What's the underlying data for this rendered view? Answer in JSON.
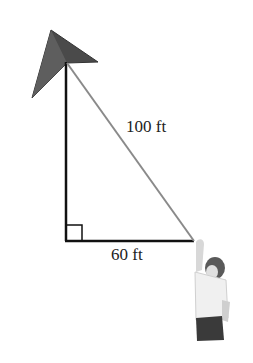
{
  "diagram": {
    "hypotenuse_label": "100 ft",
    "base_label": "60 ft",
    "elements": [
      "kite",
      "vertical-leg",
      "horizontal-leg",
      "kite-string",
      "right-angle-marker",
      "person"
    ],
    "colors": {
      "kite_fill": "#555555",
      "leg_stroke": "#111111",
      "string_stroke": "#888888"
    }
  }
}
